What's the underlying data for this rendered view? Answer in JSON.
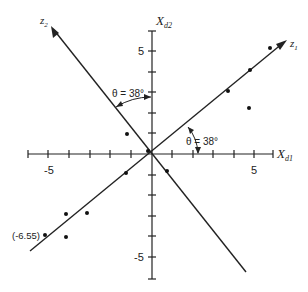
{
  "figure": {
    "axes": {
      "x_label": "X",
      "x_sub": "d1",
      "y_label": "X",
      "y_sub": "d2",
      "x_tick_labels": [
        "-5",
        "5"
      ],
      "y_tick_labels": [
        "5",
        "-5"
      ],
      "range": [
        -6,
        6
      ]
    },
    "rotated_axes": {
      "z1_label": "z",
      "z1_sub": "1",
      "z2_label": "z",
      "z2_sub": "2"
    },
    "angles": {
      "upper": "θ = 38°",
      "lower": "θ = 38°"
    },
    "annotation": "(-6.55)",
    "points": [
      {
        "x": 5.7,
        "y": 5.2
      },
      {
        "x": 4.8,
        "y": 4.1
      },
      {
        "x": 3.7,
        "y": 3.1
      },
      {
        "x": 4.7,
        "y": 2.2
      },
      {
        "x": -1.2,
        "y": 1.0
      },
      {
        "x": -0.2,
        "y": 0.1
      },
      {
        "x": -1.3,
        "y": -0.9
      },
      {
        "x": 0.7,
        "y": -0.8
      },
      {
        "x": -4.2,
        "y": -2.9
      },
      {
        "x": -3.2,
        "y": -2.9
      },
      {
        "x": -5.2,
        "y": -3.9
      },
      {
        "x": -4.2,
        "y": -4.0
      }
    ]
  }
}
